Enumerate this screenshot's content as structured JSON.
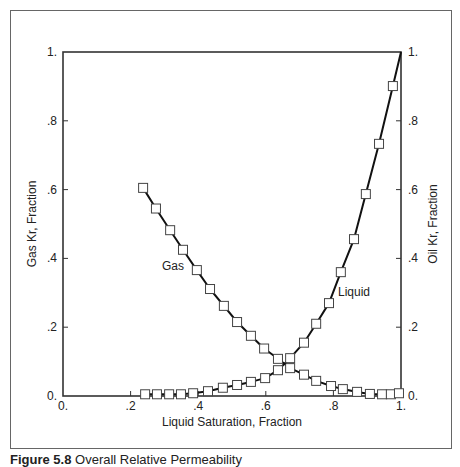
{
  "caption": {
    "label": "Figure 5.8",
    "text": "Overall Relative Permeability"
  },
  "chart_data": {
    "type": "line",
    "title": "",
    "xlabel": "Liquid Saturation, Fraction",
    "ylabel_left": "Gas Kr, Fraction",
    "ylabel_right": "Oil Kr, Fraction",
    "xlim": [
      0,
      1
    ],
    "ylim": [
      0,
      1
    ],
    "grid": false,
    "x_ticks": [
      "0.",
      ".2",
      ".4",
      ".6",
      ".8",
      "1."
    ],
    "y_ticks_left": [
      "0.",
      ".2",
      ".4",
      ".6",
      ".8",
      "1."
    ],
    "y_ticks_right": [
      "0.",
      ".2",
      ".4",
      ".6",
      ".8",
      "1."
    ],
    "legend_position": "inline labels",
    "annotations": [
      {
        "text": "Gas",
        "x": 0.29,
        "y": 0.4
      },
      {
        "text": "Liquid",
        "x": 0.74,
        "y": 0.3
      }
    ],
    "series": [
      {
        "name": "Gas",
        "marker": "open-square",
        "x": [
          0.237,
          0.275,
          0.317,
          0.355,
          0.396,
          0.435,
          0.476,
          0.515,
          0.556,
          0.595,
          0.636,
          0.672,
          0.713,
          0.749,
          0.793,
          0.828,
          0.87,
          0.908,
          0.944,
          0.97,
          0.994
        ],
        "y": [
          0.605,
          0.545,
          0.482,
          0.425,
          0.366,
          0.311,
          0.262,
          0.215,
          0.175,
          0.138,
          0.108,
          0.081,
          0.062,
          0.044,
          0.029,
          0.02,
          0.012,
          0.006,
          0.005,
          0.005,
          0.008
        ]
      },
      {
        "name": "Liquid",
        "marker": "open-square",
        "x": [
          0.243,
          0.278,
          0.314,
          0.349,
          0.385,
          0.429,
          0.473,
          0.515,
          0.556,
          0.598,
          0.636,
          0.672,
          0.713,
          0.749,
          0.787,
          0.822,
          0.861,
          0.896,
          0.935,
          0.976,
          1.0
        ],
        "y": [
          0.005,
          0.005,
          0.005,
          0.005,
          0.008,
          0.014,
          0.024,
          0.032,
          0.041,
          0.052,
          0.075,
          0.11,
          0.155,
          0.21,
          0.27,
          0.36,
          0.456,
          0.587,
          0.733,
          0.901,
          1.0
        ],
        "last_point_marker": false
      }
    ]
  }
}
